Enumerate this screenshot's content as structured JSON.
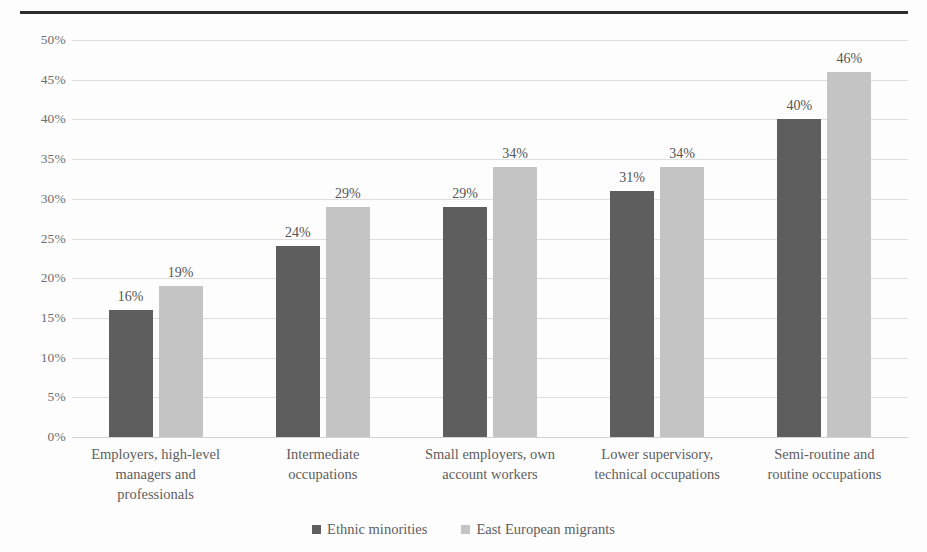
{
  "chart_data": {
    "type": "bar",
    "title": "",
    "subtitle": "",
    "xlabel": "",
    "ylabel": "",
    "ylim": [
      0,
      50
    ],
    "ytick_values": [
      0,
      5,
      10,
      15,
      20,
      25,
      30,
      35,
      40,
      45,
      50
    ],
    "ytick_labels": [
      "0%",
      "5%",
      "10%",
      "15%",
      "20%",
      "25%",
      "30%",
      "35%",
      "40%",
      "45%",
      "50%"
    ],
    "grid": true,
    "legend_position": "bottom",
    "categories": [
      "Employers, high-level managers and professionals",
      "Intermediate occupations",
      "Small employers, own account workers",
      "Lower supervisory, technical occupations",
      "Semi-routine and routine occupations"
    ],
    "category_lines": [
      [
        "Employers, high-level",
        "managers and",
        "professionals"
      ],
      [
        "Intermediate",
        "occupations"
      ],
      [
        "Small employers, own",
        "account workers"
      ],
      [
        "Lower supervisory,",
        "technical occupations"
      ],
      [
        "Semi-routine and",
        "routine occupations"
      ]
    ],
    "series": [
      {
        "name": "Ethnic minorities",
        "color": "#5e5e5e",
        "values": [
          16,
          24,
          29,
          31,
          40
        ],
        "labels": [
          "16%",
          "24%",
          "29%",
          "31%",
          "40%"
        ]
      },
      {
        "name": "East European migrants",
        "color": "#c4c4c4",
        "values": [
          19,
          29,
          34,
          34,
          46
        ],
        "labels": [
          "19%",
          "29%",
          "34%",
          "34%",
          "46%"
        ]
      }
    ]
  },
  "legend": {
    "items": [
      {
        "label": "Ethnic minorities",
        "color": "#5e5e5e"
      },
      {
        "label": "East European migrants",
        "color": "#c4c4c4"
      }
    ]
  }
}
